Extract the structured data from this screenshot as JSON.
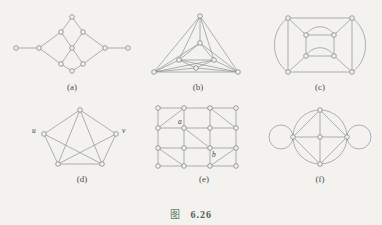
{
  "figure": {
    "cjk_label": "图",
    "number": "6.26",
    "background_color": "#f3f2ef",
    "line_color": "#8e9096",
    "node_stroke_color": "#76787e",
    "caption_color": "#4e4f52",
    "figlabel_color": "#4d6b52"
  },
  "subfigures": [
    {
      "id": "a",
      "caption": "(a)",
      "description": "diamond lattice grid with two pendant vertices",
      "vertex_count": 11,
      "vertex_labels": []
    },
    {
      "id": "b",
      "caption": "(b)",
      "description": "nested triangles with connecting edges",
      "vertex_count": 7,
      "vertex_labels": []
    },
    {
      "id": "c",
      "caption": "(c)",
      "description": "outer square and inner square joined, with curved multi-edges",
      "vertex_count": 8,
      "vertex_labels": []
    },
    {
      "id": "d",
      "caption": "(d)",
      "description": "complete graph K5 minus the edge uv",
      "vertex_count": 5,
      "vertex_labels": [
        "u",
        "v"
      ]
    },
    {
      "id": "e",
      "caption": "(e)",
      "description": "4 by 4 grid graph with selected diagonals",
      "vertex_count": 16,
      "vertex_labels": [
        "a",
        "b"
      ]
    },
    {
      "id": "f",
      "caption": "(f)",
      "description": "wheel-like graph on a circle with two self-loops",
      "vertex_count": 5,
      "vertex_labels": []
    }
  ]
}
